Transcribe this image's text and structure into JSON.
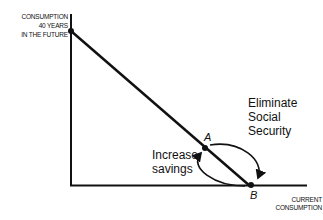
{
  "diagram": {
    "y_axis_label": [
      "CONSUMPTION",
      "40 YEARS",
      "IN THE FUTURE"
    ],
    "x_axis_label": [
      "CURRENT",
      "CONSUMPTION"
    ],
    "points": [
      {
        "id": "A",
        "label": "A"
      },
      {
        "id": "B",
        "label": "B"
      }
    ],
    "annotations": {
      "eliminate": [
        "Eliminate",
        "Social",
        "Security"
      ],
      "increase": [
        "Increase",
        "savings"
      ]
    },
    "colors": {
      "line": "#111111",
      "background": "#ffffff"
    }
  }
}
